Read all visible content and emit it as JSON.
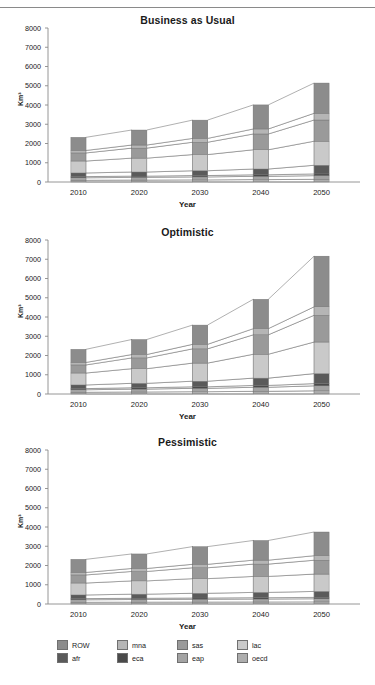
{
  "figure": {
    "axis_label_y": "Km³",
    "axis_label_x": "Year",
    "y_ticks": [
      "0",
      "1000",
      "2000",
      "3000",
      "4000",
      "5000",
      "6000",
      "7000",
      "8000"
    ],
    "x_ticks": [
      "2010",
      "2020",
      "2030",
      "2040",
      "2050"
    ]
  },
  "legend": {
    "row1": [
      {
        "label": "ROW",
        "color": "#8c8c8c"
      },
      {
        "label": "mna",
        "color": "#b5b5b5"
      },
      {
        "label": "sas",
        "color": "#9a9a9a"
      },
      {
        "label": "lac",
        "color": "#c9c9c9"
      }
    ],
    "row2": [
      {
        "label": "afr",
        "color": "#5a5a5a"
      },
      {
        "label": "eca",
        "color": "#4a4a4a"
      },
      {
        "label": "eap",
        "color": "#a3a3a3"
      },
      {
        "label": "oecd",
        "color": "#adadad"
      }
    ]
  },
  "chart_data": [
    {
      "type": "area",
      "title": "Business as Usual",
      "xlabel": "Year",
      "ylabel": "Km³",
      "categories": [
        "2010",
        "2020",
        "2030",
        "2040",
        "2050"
      ],
      "ylim": [
        0,
        8000
      ],
      "grid": false,
      "legend_position": "bottom",
      "series": [
        {
          "name": "oecd",
          "color": "#adadad",
          "values": [
            90,
            100,
            110,
            125,
            140
          ]
        },
        {
          "name": "eap",
          "color": "#a3a3a3",
          "values": [
            130,
            140,
            155,
            170,
            190
          ]
        },
        {
          "name": "eca",
          "color": "#4a4a4a",
          "values": [
            60,
            65,
            70,
            80,
            90
          ]
        },
        {
          "name": "afr",
          "color": "#5a5a5a",
          "values": [
            190,
            215,
            250,
            300,
            450
          ]
        },
        {
          "name": "lac",
          "color": "#c9c9c9",
          "values": [
            620,
            720,
            840,
            1000,
            1250
          ]
        },
        {
          "name": "sas",
          "color": "#9a9a9a",
          "values": [
            420,
            520,
            640,
            820,
            1100
          ]
        },
        {
          "name": "mna",
          "color": "#b5b5b5",
          "values": [
            130,
            160,
            200,
            260,
            350
          ]
        },
        {
          "name": "ROW",
          "color": "#8c8c8c",
          "values": [
            680,
            780,
            950,
            1250,
            1570
          ]
        }
      ],
      "totals": [
        2320,
        2700,
        3215,
        4005,
        5140
      ]
    },
    {
      "type": "area",
      "title": "Optimistic",
      "xlabel": "Year",
      "ylabel": "Km³",
      "categories": [
        "2010",
        "2020",
        "2030",
        "2040",
        "2050"
      ],
      "ylim": [
        0,
        8000
      ],
      "grid": false,
      "legend_position": "bottom",
      "series": [
        {
          "name": "oecd",
          "color": "#adadad",
          "values": [
            90,
            105,
            120,
            140,
            165
          ]
        },
        {
          "name": "eap",
          "color": "#a3a3a3",
          "values": [
            130,
            150,
            175,
            210,
            260
          ]
        },
        {
          "name": "eca",
          "color": "#4a4a4a",
          "values": [
            60,
            70,
            80,
            95,
            115
          ]
        },
        {
          "name": "afr",
          "color": "#5a5a5a",
          "values": [
            190,
            230,
            290,
            380,
            520
          ]
        },
        {
          "name": "lac",
          "color": "#c9c9c9",
          "values": [
            620,
            760,
            940,
            1240,
            1640
          ]
        },
        {
          "name": "sas",
          "color": "#9a9a9a",
          "values": [
            420,
            560,
            740,
            1010,
            1390
          ]
        },
        {
          "name": "mna",
          "color": "#b5b5b5",
          "values": [
            130,
            175,
            235,
            320,
            440
          ]
        },
        {
          "name": "ROW",
          "color": "#8c8c8c",
          "values": [
            680,
            780,
            1000,
            1525,
            2630
          ]
        }
      ],
      "totals": [
        2320,
        2830,
        3580,
        4920,
        7160
      ]
    },
    {
      "type": "area",
      "title": "Pessimistic",
      "xlabel": "Year",
      "ylabel": "Km³",
      "categories": [
        "2010",
        "2020",
        "2030",
        "2040",
        "2050"
      ],
      "ylim": [
        0,
        8000
      ],
      "grid": false,
      "legend_position": "bottom",
      "series": [
        {
          "name": "oecd",
          "color": "#adadad",
          "values": [
            90,
            95,
            100,
            105,
            110
          ]
        },
        {
          "name": "eap",
          "color": "#a3a3a3",
          "values": [
            130,
            138,
            146,
            154,
            162
          ]
        },
        {
          "name": "eca",
          "color": "#4a4a4a",
          "values": [
            60,
            63,
            66,
            69,
            72
          ]
        },
        {
          "name": "afr",
          "color": "#5a5a5a",
          "values": [
            190,
            215,
            245,
            275,
            310
          ]
        },
        {
          "name": "lac",
          "color": "#c9c9c9",
          "values": [
            620,
            690,
            760,
            830,
            900
          ]
        },
        {
          "name": "sas",
          "color": "#9a9a9a",
          "values": [
            420,
            490,
            565,
            640,
            720
          ]
        },
        {
          "name": "mna",
          "color": "#b5b5b5",
          "values": [
            130,
            155,
            180,
            205,
            235
          ]
        },
        {
          "name": "ROW",
          "color": "#8c8c8c",
          "values": [
            680,
            754,
            918,
            1022,
            1231
          ]
        }
      ],
      "totals": [
        2320,
        2600,
        2980,
        3300,
        3740
      ]
    }
  ]
}
